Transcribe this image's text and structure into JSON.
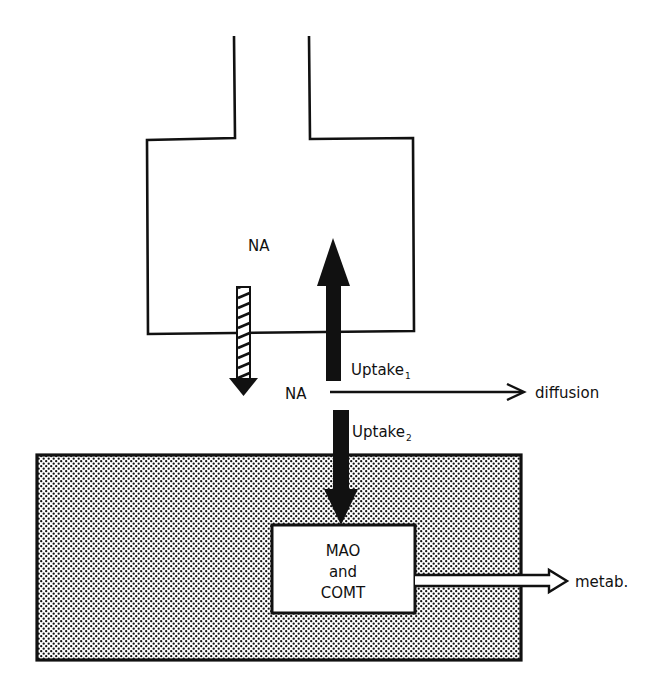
{
  "diagram": {
    "labels": {
      "na_inside": "NA",
      "na_outside": "NA",
      "uptake1_base": "Uptake",
      "uptake1_sub": "1",
      "uptake2_base": "Uptake",
      "uptake2_sub": "2",
      "diffusion": "diffusion",
      "enzyme_line1": "MAO",
      "enzyme_line2": "and",
      "enzyme_line3": "COMT",
      "metab": "metab."
    },
    "colors": {
      "ink": "#111111",
      "background": "#ffffff"
    },
    "elements": {
      "nerve_terminal": "neuron-terminal-outline",
      "effector_cell": "stippled-effector-cell",
      "release_arrow": "hatched-down-arrow",
      "uptake1_arrow": "solid-up-arrow",
      "uptake2_arrow": "solid-down-arrow",
      "diffusion_arrow": "thin-right-arrow",
      "metab_arrow": "hollow-right-arrow"
    }
  }
}
